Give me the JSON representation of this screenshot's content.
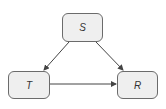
{
  "diagram": {
    "nodes": [
      {
        "id": "S",
        "label": "S"
      },
      {
        "id": "T",
        "label": "T"
      },
      {
        "id": "R",
        "label": "R"
      }
    ],
    "edges": [
      {
        "from": "S",
        "to": "T"
      },
      {
        "from": "S",
        "to": "R"
      },
      {
        "from": "T",
        "to": "R"
      }
    ],
    "colors": {
      "node_fill": "#efefef",
      "node_border": "#6b6b6b",
      "edge": "#444444"
    }
  }
}
